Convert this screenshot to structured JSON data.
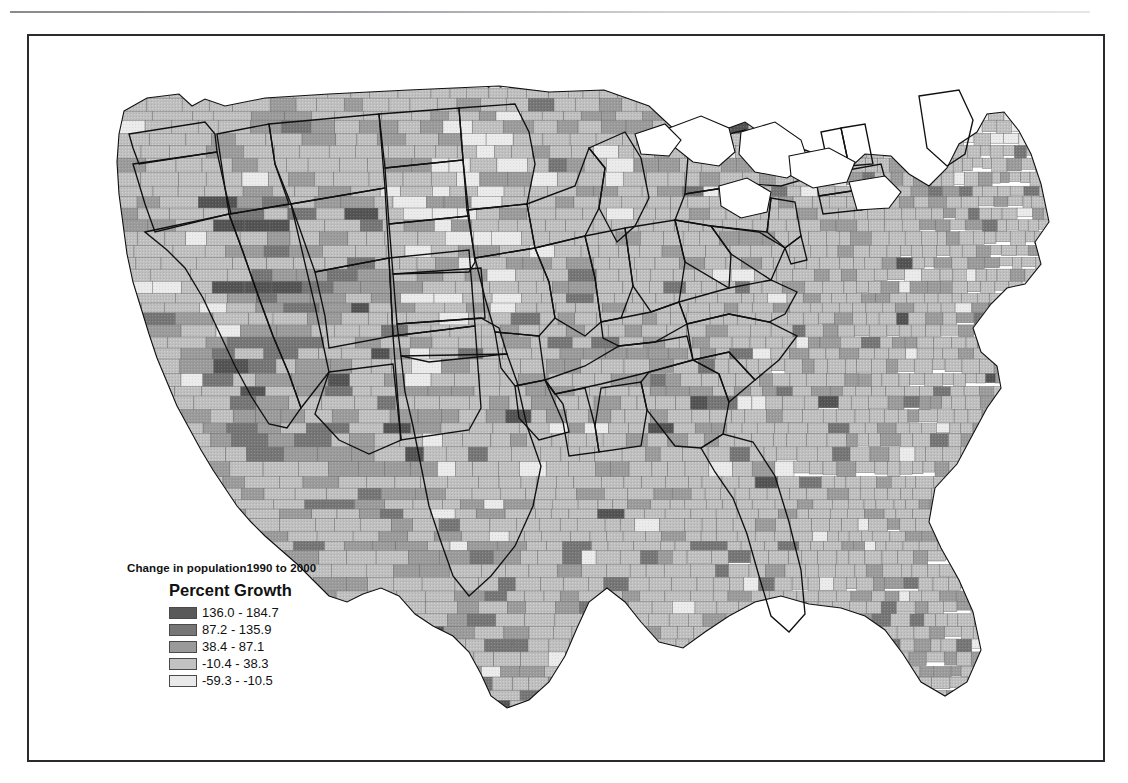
{
  "page": {
    "background_color": "#ffffff",
    "frame_color": "#2b2b2f",
    "top_rule": "horizontal-rule"
  },
  "map": {
    "title": "Equal-interval classification",
    "subject": "United States counties",
    "boundary_color": "#6e6e6e",
    "state_boundary_color": "#101010"
  },
  "legend": {
    "supertitle": "Change in population1990 to 2000",
    "title": "Percent Growth",
    "classification": "equal-interval",
    "class_count": 5,
    "classes": [
      {
        "label": "136.0 - 184.7",
        "color": "#595959",
        "min": 136.0,
        "max": 184.7
      },
      {
        "label": "87.2 - 135.9",
        "color": "#767676",
        "min": 87.2,
        "max": 135.9
      },
      {
        "label": "38.4 - 87.1",
        "color": "#9a9a9a",
        "min": 38.4,
        "max": 87.1
      },
      {
        "label": "-10.4 - 38.3",
        "color": "#c2c2c2",
        "min": -10.4,
        "max": 38.3
      },
      {
        "label": "-59.3 - -10.5",
        "color": "#e9e9e9",
        "min": -59.3,
        "max": -10.5
      }
    ]
  },
  "chart_data": {
    "type": "choropleth-map",
    "title": "Equal-interval classification",
    "variable": "Percent Growth",
    "subtitle": "Change in population1990 to 2000",
    "units": "percent",
    "classification_method": "equal interval",
    "class_breaks": [
      -59.3,
      -10.5,
      38.3,
      87.1,
      135.9,
      184.7
    ],
    "class_labels": [
      "136.0 - 184.7",
      "87.2 - 135.9",
      "38.4 - 87.1",
      "-10.4 - 38.3",
      "-59.3 - -10.5"
    ],
    "class_colors": [
      "#595959",
      "#767676",
      "#9a9a9a",
      "#c2c2c2",
      "#e9e9e9"
    ],
    "geography": "US counties (conterminous 48 states)",
    "legend_position": "lower-left inside map frame"
  }
}
